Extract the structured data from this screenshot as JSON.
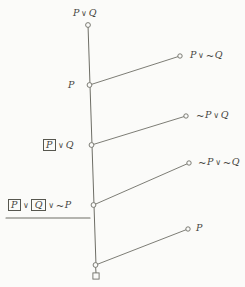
{
  "diagram": {
    "type": "propositional-derivation-tree",
    "background_color": "#fbfbf9",
    "stroke_color": "#6e6e66",
    "text_color": "#46463f",
    "spine": {
      "name": "vertical-spine",
      "top_x": 88,
      "top_y": 25,
      "bottom_x": 96,
      "bottom_y": 265
    },
    "nodes": [
      {
        "id": "n0",
        "shape": "circle",
        "x": 88,
        "y": 25
      },
      {
        "id": "n1",
        "shape": "circle",
        "x": 89.5,
        "y": 85
      },
      {
        "id": "n2",
        "shape": "circle",
        "x": 91.5,
        "y": 145
      },
      {
        "id": "n3",
        "shape": "circle",
        "x": 93.5,
        "y": 205
      },
      {
        "id": "n4",
        "shape": "circle",
        "x": 95.5,
        "y": 265
      },
      {
        "id": "t0",
        "shape": "square",
        "x": 96,
        "y": 276
      }
    ],
    "branches": [
      {
        "id": "b1",
        "from": "n1",
        "to_x": 180,
        "to_y": 56,
        "label": "P ∨ ~Q"
      },
      {
        "id": "b2",
        "from": "n2",
        "to_x": 186,
        "to_y": 116,
        "label": "~P ∨ Q"
      },
      {
        "id": "b3",
        "from": "n3",
        "to_x": 189,
        "to_y": 163,
        "label": "~P ∨ ~Q"
      },
      {
        "id": "b4",
        "from": "n4",
        "to_x": 188,
        "to_y": 229,
        "label": "P"
      }
    ],
    "rule_line": {
      "name": "horizontal-rule",
      "x1": 6,
      "x2": 90,
      "y": 218
    },
    "labels": {
      "top": {
        "name": "label-top-formula",
        "parts": [
          {
            "kind": "var",
            "text": "P"
          },
          {
            "kind": "op",
            "text": "∨"
          },
          {
            "kind": "var",
            "text": "Q"
          }
        ],
        "x": 73,
        "y": 8
      },
      "spine_1": {
        "name": "label-node-p",
        "parts": [
          {
            "kind": "var",
            "text": "P"
          }
        ],
        "x": 68,
        "y": 80
      },
      "spine_2": {
        "name": "label-node-boxed-p-or-q",
        "parts": [
          {
            "kind": "boxed",
            "text": "P"
          },
          {
            "kind": "op",
            "text": "∨"
          },
          {
            "kind": "var",
            "text": "Q"
          }
        ],
        "x": 42,
        "y": 139
      },
      "spine_3": {
        "name": "label-node-boxed-p-or-boxed-q-or-neg-p",
        "parts": [
          {
            "kind": "boxed",
            "text": "P"
          },
          {
            "kind": "op",
            "text": "∨"
          },
          {
            "kind": "boxed",
            "text": "Q"
          },
          {
            "kind": "op",
            "text": "∨"
          },
          {
            "kind": "neg",
            "text": "~"
          },
          {
            "kind": "var",
            "text": "P"
          }
        ],
        "x": 7,
        "y": 199
      },
      "branch_1": {
        "name": "label-branch-p-or-neg-q",
        "parts": [
          {
            "kind": "var",
            "text": "P"
          },
          {
            "kind": "op",
            "text": "∨"
          },
          {
            "kind": "neg",
            "text": "~"
          },
          {
            "kind": "var",
            "text": "Q"
          }
        ],
        "x": 190,
        "y": 50
      },
      "branch_2": {
        "name": "label-branch-neg-p-or-q",
        "parts": [
          {
            "kind": "neg",
            "text": "~"
          },
          {
            "kind": "var",
            "text": "P"
          },
          {
            "kind": "op",
            "text": "∨"
          },
          {
            "kind": "var",
            "text": "Q"
          }
        ],
        "x": 196,
        "y": 110
      },
      "branch_3": {
        "name": "label-branch-neg-p-or-neg-q",
        "parts": [
          {
            "kind": "neg",
            "text": "~"
          },
          {
            "kind": "var",
            "text": "P"
          },
          {
            "kind": "op",
            "text": "∨"
          },
          {
            "kind": "neg",
            "text": "~"
          },
          {
            "kind": "var",
            "text": "Q"
          }
        ],
        "x": 198,
        "y": 157
      },
      "branch_4": {
        "name": "label-branch-p",
        "parts": [
          {
            "kind": "var",
            "text": "P"
          }
        ],
        "x": 196,
        "y": 223
      }
    }
  }
}
